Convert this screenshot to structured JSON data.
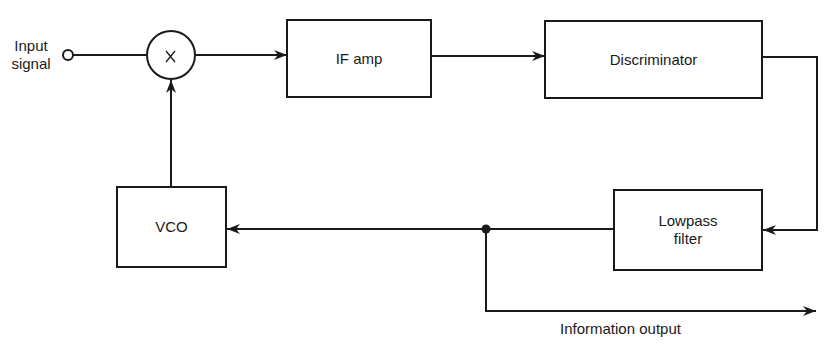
{
  "diagram": {
    "title": "",
    "input": {
      "label_line1": "Input",
      "label_line2": "signal"
    },
    "mixer": {
      "symbol": "X",
      "icon": "multiplier-icon"
    },
    "blocks": {
      "if_amp": {
        "label": "IF amp"
      },
      "discriminator": {
        "label": "Discriminator"
      },
      "lowpass": {
        "label_line1": "Lowpass",
        "label_line2": "filter"
      },
      "vco": {
        "label": "VCO"
      }
    },
    "output": {
      "label": "Information output"
    },
    "connections": [
      {
        "from": "Input signal",
        "to": "Mixer"
      },
      {
        "from": "Mixer",
        "to": "IF amp"
      },
      {
        "from": "IF amp",
        "to": "Discriminator"
      },
      {
        "from": "Discriminator",
        "to": "Lowpass filter"
      },
      {
        "from": "Lowpass filter",
        "to": "VCO"
      },
      {
        "from": "VCO",
        "to": "Mixer"
      },
      {
        "from": "Lowpass filter",
        "to": "Information output"
      }
    ],
    "colors": {
      "line": "#1a1a1a",
      "background": "#ffffff"
    }
  }
}
